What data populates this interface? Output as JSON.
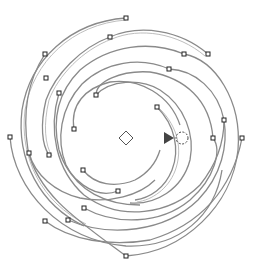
{
  "canvas": {
    "width": 255,
    "height": 273,
    "background": "#ffffff",
    "stroke_color": "#8a8a8a",
    "node_color": "#222222"
  },
  "center_marker": {
    "shape": "diamond",
    "x": 126,
    "y": 138
  },
  "rotation_handle": {
    "shape": "arrow-with-dashed-circle",
    "x": 176,
    "y": 138,
    "color": "#444444"
  },
  "nodes": [
    [
      126,
      18
    ],
    [
      110,
      37
    ],
    [
      45,
      54
    ],
    [
      46,
      78
    ],
    [
      59,
      93
    ],
    [
      96,
      95
    ],
    [
      74,
      129
    ],
    [
      10,
      137
    ],
    [
      29,
      153
    ],
    [
      49,
      155
    ],
    [
      83,
      170
    ],
    [
      184,
      54
    ],
    [
      208,
      54
    ],
    [
      169,
      69
    ],
    [
      157,
      107
    ],
    [
      224,
      120
    ],
    [
      242,
      138
    ],
    [
      213,
      138
    ],
    [
      118,
      191
    ],
    [
      84,
      208
    ],
    [
      68,
      220
    ],
    [
      45,
      221
    ],
    [
      126,
      256
    ]
  ]
}
